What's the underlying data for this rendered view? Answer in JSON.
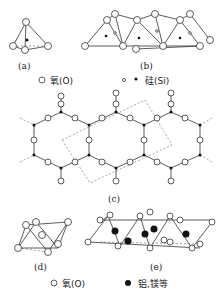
{
  "panels": {
    "a": "(a)",
    "b": "(b)",
    "c": "(c)",
    "d": "(d)",
    "e": "(e)"
  },
  "legend_top": {
    "oxygen": "氧(O)",
    "silicon": "硅(Si)"
  },
  "legend_bottom": {
    "oxygen": "氧(O)",
    "metal": "铝,镁等"
  }
}
